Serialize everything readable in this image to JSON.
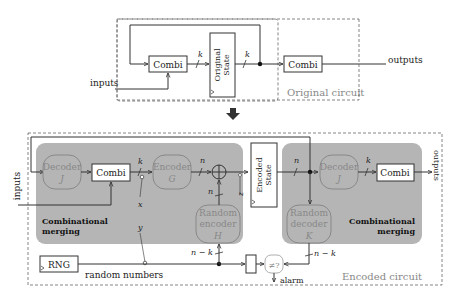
{
  "top": {
    "title": "Original circuit",
    "inputs_label": "inputs",
    "outputs_label": "outputs",
    "combi1": "Combi",
    "combi2": "Combi",
    "state_line1": "Original",
    "state_line2": "State",
    "k1": "k",
    "k2": "k"
  },
  "arrow": "down-arrow",
  "bottom": {
    "title": "Encoded circuit",
    "inputs_label": "inputs",
    "outputs_label": "outputs",
    "decoder1_line1": "Decoder",
    "decoder1_line2": "J",
    "combi1": "Combi",
    "encoder_line1": "Encoder",
    "encoder_line2": "G",
    "k1": "k",
    "n1": "n",
    "n2": "n",
    "n3": "n",
    "n_state": "n",
    "x_label": "x",
    "y_label": "y",
    "rand_enc_line1": "Random",
    "rand_enc_line2": "encoder",
    "rand_enc_line3": "H",
    "state_line1": "Encoded",
    "state_line2": "State",
    "decoder2_line1": "Decoder",
    "decoder2_line2": "J",
    "k2": "k",
    "combi2": "Combi",
    "rand_dec_line1": "Random",
    "rand_dec_line2": "decoder",
    "rand_dec_line3": "K",
    "merge_left_line1": "Combinational",
    "merge_left_line2": "merging",
    "merge_right_line1": "Combinational",
    "merge_right_line2": "merging",
    "rng": "RNG",
    "random_numbers": "random numbers",
    "nk1": "n − k",
    "nk2": "n − k",
    "compare": "≠?",
    "alarm": "alarm"
  },
  "colors": {
    "merge_fill": "#b5b5b5",
    "line": "#333333"
  }
}
